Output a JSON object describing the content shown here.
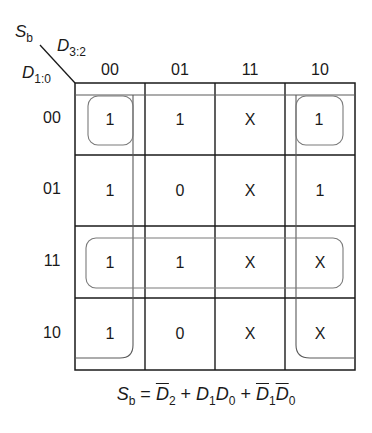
{
  "diagram": {
    "type": "karnaugh-map",
    "output_label": "S",
    "output_sub": "b",
    "column_var": "D",
    "column_var_sub": "3:2",
    "row_var": "D",
    "row_var_sub": "1:0",
    "columns": [
      "00",
      "01",
      "11",
      "10"
    ],
    "rows": [
      "00",
      "01",
      "11",
      "10"
    ],
    "cells": [
      [
        "1",
        "1",
        "X",
        "1"
      ],
      [
        "1",
        "0",
        "X",
        "1"
      ],
      [
        "1",
        "1",
        "X",
        "X"
      ],
      [
        "1",
        "0",
        "X",
        "X"
      ]
    ],
    "groups": [
      {
        "name": "not-D2",
        "covers": "columns 00 and 10 (wrap-around)"
      },
      {
        "name": "D1-D0",
        "covers": "row 11"
      },
      {
        "name": "not-D1-not-D0",
        "covers": "four corners (row 00, columns 00 and 10)"
      }
    ],
    "equation": {
      "lhs": "S",
      "lhs_sub": "b",
      "eq": " = ",
      "t1": "D",
      "t1_sub": "2",
      "plus1": " + ",
      "t2a": "D",
      "t2a_sub": "1",
      "t2b": "D",
      "t2b_sub": "0",
      "plus2": " + ",
      "t3a": "D",
      "t3a_sub": "1",
      "t3b": "D",
      "t3b_sub": "0"
    },
    "colors": {
      "grid": "#1a1a1a",
      "group_outline": "#8a8a8a"
    }
  }
}
